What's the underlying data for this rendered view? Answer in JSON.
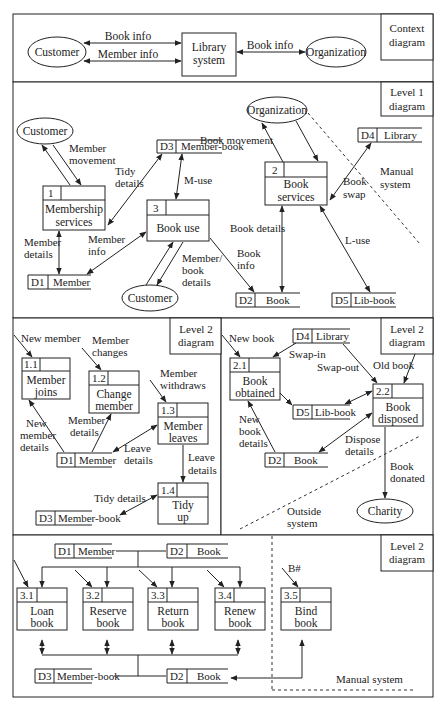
{
  "context": {
    "tag": [
      "Context",
      "diagram"
    ],
    "customer": "Customer",
    "system": [
      "Library",
      "system"
    ],
    "organization": "Organization",
    "flows": {
      "book_info_left": "Book info",
      "member_info": "Member info",
      "book_info_right": "Book info"
    }
  },
  "level1": {
    "tag": [
      "Level 1",
      "diagram"
    ],
    "customer_top": "Customer",
    "customer_bottom": "Customer",
    "organization": "Organization",
    "p1": {
      "id": "1",
      "name": [
        "Membership",
        "services"
      ]
    },
    "p2": {
      "id": "2",
      "name": [
        "Book",
        "services"
      ]
    },
    "p3": {
      "id": "3",
      "name": [
        "Book use"
      ]
    },
    "d1": {
      "id": "D1",
      "name": "Member"
    },
    "d2": {
      "id": "D2",
      "name": "Book"
    },
    "d3": {
      "id": "D3",
      "name": "Member-book"
    },
    "d4": {
      "id": "D4",
      "name": "Library"
    },
    "d5": {
      "id": "D5",
      "name": "Lib-book"
    },
    "flows": {
      "member_movement": [
        "Member",
        "movement"
      ],
      "tidy_details": [
        "Tidy",
        "details"
      ],
      "m_use": "M-use",
      "book_movement": "Book movement",
      "book_swap": [
        "Book",
        "swap"
      ],
      "manual_system": [
        "Manual",
        "system"
      ],
      "member_details": [
        "Member",
        "details"
      ],
      "member_info": [
        "Member",
        "info"
      ],
      "member_book_details": [
        "Member/",
        "book",
        "details"
      ],
      "book_details": "Book details",
      "book_info": [
        "Book",
        "info"
      ],
      "l_use": "L-use"
    }
  },
  "level2a": {
    "tag": [
      "Level 2",
      "diagram"
    ],
    "p11": {
      "id": "1.1",
      "name": [
        "Member",
        "joins"
      ]
    },
    "p12": {
      "id": "1.2",
      "name": [
        "Change",
        "member"
      ]
    },
    "p13": {
      "id": "1.3",
      "name": [
        "Member",
        "leaves"
      ]
    },
    "p14": {
      "id": "1.4",
      "name": [
        "Tidy",
        "up"
      ]
    },
    "d1": {
      "id": "D1",
      "name": "Member"
    },
    "d3": {
      "id": "D3",
      "name": "Member-book"
    },
    "flows": {
      "new_member": "New member",
      "member_changes": [
        "Member",
        "changes"
      ],
      "member_withdraws": [
        "Member",
        "withdraws"
      ],
      "new_member_details": [
        "New",
        "member",
        "details"
      ],
      "member_details": [
        "Member",
        "details"
      ],
      "leave_details_a": [
        "Leave",
        "details"
      ],
      "leave_details_b": [
        "Leave",
        "details"
      ],
      "tidy_details": "Tidy details"
    }
  },
  "level2b": {
    "tag": [
      "Level 2",
      "diagram"
    ],
    "p21": {
      "id": "2.1",
      "name": [
        "Book",
        "obtained"
      ]
    },
    "p22": {
      "id": "2.2",
      "name": [
        "Book",
        "disposed"
      ]
    },
    "d4": {
      "id": "D4",
      "name": "Library"
    },
    "d5": {
      "id": "D5",
      "name": "Lib-book"
    },
    "d2": {
      "id": "D2",
      "name": "Book"
    },
    "charity": "Charity",
    "flows": {
      "new_book": "New book",
      "swap_in": "Swap-in",
      "swap_out": "Swap-out",
      "old_book": "Old book",
      "new_book_details": [
        "New",
        "book",
        "details"
      ],
      "dispose_details": [
        "Dispose",
        "details"
      ],
      "book_donated": [
        "Book",
        "donated"
      ],
      "outside_system": [
        "Outside",
        "system"
      ]
    }
  },
  "level2c": {
    "tag": [
      "Level 2",
      "diagram"
    ],
    "d1": {
      "id": "D1",
      "name": "Member"
    },
    "d2_top": {
      "id": "D2",
      "name": "Book"
    },
    "d3": {
      "id": "D3",
      "name": "Member-book"
    },
    "d2_bottom": {
      "id": "D2",
      "name": "Book"
    },
    "p31": {
      "id": "3.1",
      "name": [
        "Loan",
        "book"
      ]
    },
    "p32": {
      "id": "3.2",
      "name": [
        "Reserve",
        "book"
      ]
    },
    "p33": {
      "id": "3.3",
      "name": [
        "Return",
        "book"
      ]
    },
    "p34": {
      "id": "3.4",
      "name": [
        "Renew",
        "book"
      ]
    },
    "p35": {
      "id": "3.5",
      "name": [
        "Bind",
        "book"
      ]
    },
    "flows": {
      "b_hash": "B#",
      "manual_system": "Manual system"
    }
  }
}
